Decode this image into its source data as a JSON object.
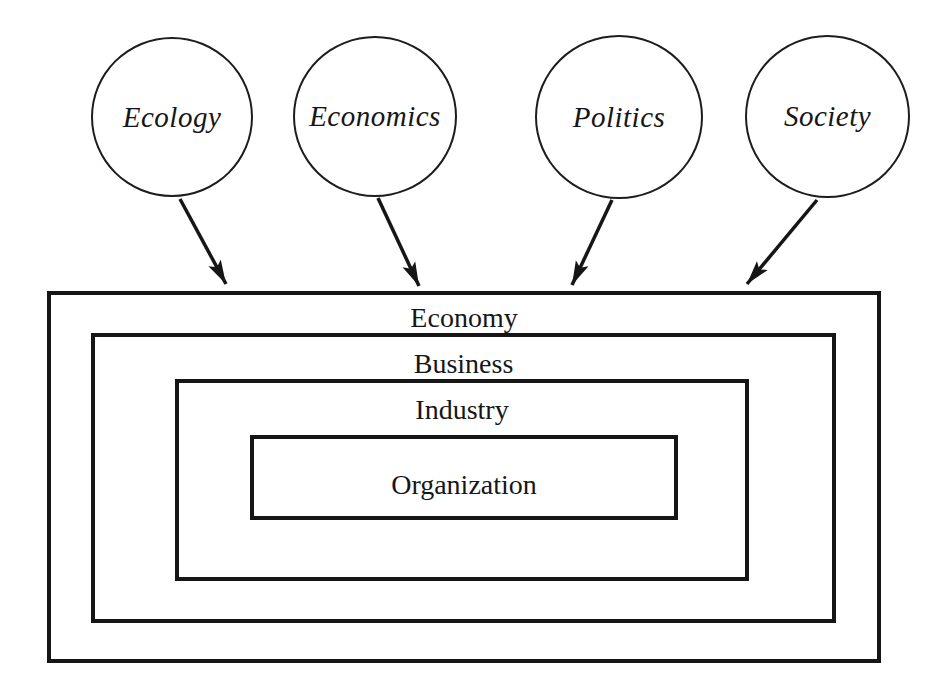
{
  "diagram": {
    "environment_circles": [
      {
        "label": "Ecology"
      },
      {
        "label": "Economics"
      },
      {
        "label": "Politics"
      },
      {
        "label": "Society"
      }
    ],
    "nested_levels": [
      {
        "label": "Economy"
      },
      {
        "label": "Business"
      },
      {
        "label": "Industry"
      },
      {
        "label": "Organization"
      }
    ],
    "arrows": [
      {
        "from": "Ecology",
        "to": "Economy"
      },
      {
        "from": "Economics",
        "to": "Economy"
      },
      {
        "from": "Politics",
        "to": "Economy"
      },
      {
        "from": "Society",
        "to": "Economy"
      }
    ],
    "colors": {
      "line": "#161616",
      "background": "#ffffff"
    }
  }
}
